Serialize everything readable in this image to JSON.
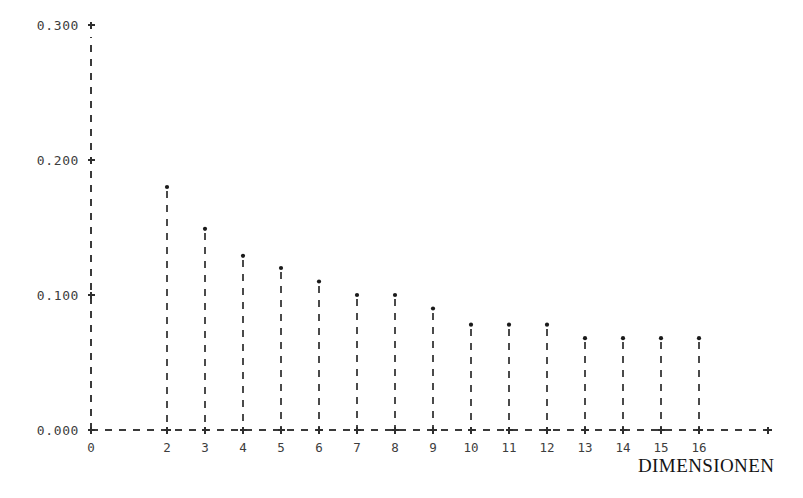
{
  "chart_data": {
    "type": "scatter",
    "title": "",
    "subtitle": "",
    "xlabel": "DIMENSIONEN",
    "ylabel": "",
    "x": [
      2,
      3,
      4,
      5,
      6,
      7,
      8,
      9,
      10,
      11,
      12,
      13,
      14,
      15,
      16
    ],
    "values": [
      0.18,
      0.149,
      0.129,
      0.12,
      0.11,
      0.1,
      0.1,
      0.09,
      0.078,
      0.078,
      0.078,
      0.068,
      0.068,
      0.068,
      0.068
    ],
    "series": [
      {
        "name": "eigenvalue",
        "values": [
          0.18,
          0.149,
          0.129,
          0.12,
          0.11,
          0.1,
          0.1,
          0.09,
          0.078,
          0.078,
          0.078,
          0.068,
          0.068,
          0.068,
          0.068
        ]
      }
    ],
    "xlim": [
      0,
      18
    ],
    "ylim": [
      0.0,
      0.3
    ],
    "x_tick_labels": [
      "0",
      "2",
      "3",
      "4",
      "5",
      "6",
      "7",
      "8",
      "9",
      "10",
      "11",
      "12",
      "13",
      "14",
      "15",
      "16"
    ],
    "x_tick_values": [
      0,
      2,
      3,
      4,
      5,
      6,
      7,
      8,
      9,
      10,
      11,
      12,
      13,
      14,
      15,
      16
    ],
    "y_tick_labels": [
      "0.000",
      "0.100",
      "0.200",
      "0.300"
    ],
    "y_tick_values": [
      0.0,
      0.1,
      0.2,
      0.3
    ],
    "grid": false,
    "legend": null,
    "marker": "dot",
    "stems": true,
    "axis_style": "dashed",
    "tick_marker": "+",
    "colors": {
      "background": "#ffffff",
      "axis": "#3a3a3a",
      "marker": "#1a1a1a",
      "text": "#3d3d3d",
      "title_text": "#141414"
    }
  }
}
